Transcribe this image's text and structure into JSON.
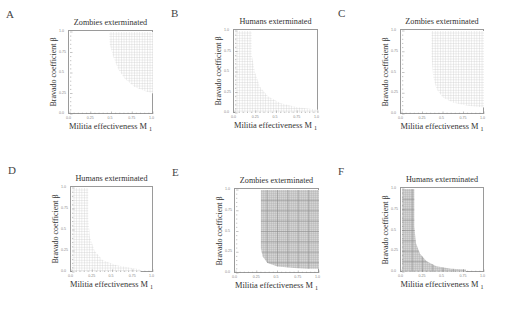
{
  "figure": {
    "panels": [
      {
        "letter": "A",
        "title": "Zombies exterminated",
        "xlabel": "Militia effectiveness M",
        "xsub": "1",
        "ylabel": "Bravado coefficient β",
        "frame": {
          "x": 68,
          "y": 30,
          "w": 85,
          "h": 84
        },
        "density": "sparse",
        "region": "upper-right",
        "boundary": [
          [
            0.47,
            1.0
          ],
          [
            0.48,
            0.85
          ],
          [
            0.52,
            0.7
          ],
          [
            0.58,
            0.55
          ],
          [
            0.66,
            0.43
          ],
          [
            0.78,
            0.33
          ],
          [
            0.9,
            0.28
          ],
          [
            1.0,
            0.25
          ]
        ]
      },
      {
        "letter": "B",
        "title": "Humans exterminated",
        "xlabel": "Militia effectiveness M",
        "xsub": "1",
        "ylabel": "Bravado coefficient β",
        "frame": {
          "x": 233,
          "y": 29,
          "w": 85,
          "h": 84
        },
        "density": "sparse",
        "region": "lower-left",
        "boundary": [
          [
            0.2,
            1.0
          ],
          [
            0.2,
            0.72
          ],
          [
            0.24,
            0.5
          ],
          [
            0.3,
            0.32
          ],
          [
            0.4,
            0.2
          ],
          [
            0.55,
            0.12
          ],
          [
            0.75,
            0.07
          ],
          [
            1.0,
            0.04
          ]
        ]
      },
      {
        "letter": "C",
        "title": "Zombies exterminated",
        "xlabel": "Militia effectiveness M",
        "xsub": "1",
        "ylabel": "Bravado coefficient β",
        "frame": {
          "x": 400,
          "y": 29,
          "w": 84,
          "h": 85
        },
        "density": "sparse",
        "region": "upper-right",
        "boundary": [
          [
            0.36,
            1.0
          ],
          [
            0.36,
            0.7
          ],
          [
            0.38,
            0.45
          ],
          [
            0.42,
            0.3
          ],
          [
            0.5,
            0.2
          ],
          [
            0.62,
            0.14
          ],
          [
            0.8,
            0.1
          ],
          [
            1.0,
            0.08
          ]
        ]
      },
      {
        "letter": "D",
        "title": "Humans exterminated",
        "xlabel": "Militia effectiveness M",
        "xsub": "1",
        "ylabel": "Bravado coefficient β",
        "frame": {
          "x": 70,
          "y": 186,
          "w": 83,
          "h": 86
        },
        "density": "sparse",
        "region": "lower-left",
        "boundary": [
          [
            0.2,
            1.0
          ],
          [
            0.2,
            0.65
          ],
          [
            0.22,
            0.42
          ],
          [
            0.28,
            0.25
          ],
          [
            0.38,
            0.14
          ],
          [
            0.55,
            0.08
          ],
          [
            0.72,
            0.05
          ],
          [
            0.85,
            0.03
          ]
        ]
      },
      {
        "letter": "E",
        "title": "Zombies exterminated",
        "xlabel": "Militia effectiveness M",
        "xsub": "1",
        "ylabel": "Bravado coefficient β",
        "frame": {
          "x": 234,
          "y": 188,
          "w": 85,
          "h": 85
        },
        "density": "dense",
        "region": "upper-right",
        "boundary": [
          [
            0.3,
            1.0
          ],
          [
            0.3,
            0.7
          ],
          [
            0.3,
            0.3
          ],
          [
            0.32,
            0.2
          ],
          [
            0.38,
            0.12
          ],
          [
            0.5,
            0.08
          ],
          [
            0.7,
            0.06
          ],
          [
            0.85,
            0.05
          ],
          [
            1.0,
            0.05
          ]
        ]
      },
      {
        "letter": "F",
        "title": "Humans exterminated",
        "xlabel": "Militia effectiveness M",
        "xsub": "1",
        "ylabel": "Bravado coefficient β",
        "frame": {
          "x": 400,
          "y": 187,
          "w": 84,
          "h": 85
        },
        "density": "dense",
        "region": "lower-left",
        "boundary": [
          [
            0.15,
            1.0
          ],
          [
            0.15,
            0.55
          ],
          [
            0.17,
            0.35
          ],
          [
            0.22,
            0.22
          ],
          [
            0.3,
            0.13
          ],
          [
            0.42,
            0.07
          ],
          [
            0.6,
            0.04
          ],
          [
            0.78,
            0.03
          ]
        ]
      }
    ],
    "xticks": [
      "0.0",
      "0.25",
      "0.5",
      "0.75",
      "1.0"
    ],
    "yticks": [
      "0.0",
      "0.25",
      "0.5",
      "0.75",
      "1.0"
    ]
  },
  "chart_data": [
    {
      "type": "heatmap",
      "panel": "A",
      "title": "Zombies exterminated",
      "xlabel": "Militia effectiveness M1",
      "ylabel": "Bravado coefficient β",
      "xlim": [
        0,
        1
      ],
      "ylim": [
        0,
        1
      ],
      "region_boundary": {
        "x": [
          0.47,
          0.48,
          0.52,
          0.58,
          0.66,
          0.78,
          0.9,
          1.0
        ],
        "y": [
          1.0,
          0.85,
          0.7,
          0.55,
          0.43,
          0.33,
          0.28,
          0.25
        ]
      },
      "shaded": "above boundary"
    },
    {
      "type": "heatmap",
      "panel": "B",
      "title": "Humans exterminated",
      "xlabel": "Militia effectiveness M1",
      "ylabel": "Bravado coefficient β",
      "xlim": [
        0,
        1
      ],
      "ylim": [
        0,
        1
      ],
      "region_boundary": {
        "x": [
          0.2,
          0.2,
          0.24,
          0.3,
          0.4,
          0.55,
          0.75,
          1.0
        ],
        "y": [
          1.0,
          0.72,
          0.5,
          0.32,
          0.2,
          0.12,
          0.07,
          0.04
        ]
      },
      "shaded": "below boundary"
    },
    {
      "type": "heatmap",
      "panel": "C",
      "title": "Zombies exterminated",
      "xlabel": "Militia effectiveness M1",
      "ylabel": "Bravado coefficient β",
      "xlim": [
        0,
        1
      ],
      "ylim": [
        0,
        1
      ],
      "region_boundary": {
        "x": [
          0.36,
          0.36,
          0.38,
          0.42,
          0.5,
          0.62,
          0.8,
          1.0
        ],
        "y": [
          1.0,
          0.7,
          0.45,
          0.3,
          0.2,
          0.14,
          0.1,
          0.08
        ]
      },
      "shaded": "above boundary"
    },
    {
      "type": "heatmap",
      "panel": "D",
      "title": "Humans exterminated",
      "xlabel": "Militia effectiveness M1",
      "ylabel": "Bravado coefficient β",
      "xlim": [
        0,
        1
      ],
      "ylim": [
        0,
        1
      ],
      "region_boundary": {
        "x": [
          0.2,
          0.2,
          0.22,
          0.28,
          0.38,
          0.55,
          0.72,
          0.85
        ],
        "y": [
          1.0,
          0.65,
          0.42,
          0.25,
          0.14,
          0.08,
          0.05,
          0.03
        ]
      },
      "shaded": "below boundary"
    },
    {
      "type": "heatmap",
      "panel": "E",
      "title": "Zombies exterminated",
      "xlabel": "Militia effectiveness M1",
      "ylabel": "Bravado coefficient β",
      "xlim": [
        0,
        1
      ],
      "ylim": [
        0,
        1
      ],
      "region_boundary": {
        "x": [
          0.3,
          0.3,
          0.3,
          0.32,
          0.38,
          0.5,
          0.7,
          0.85,
          1.0
        ],
        "y": [
          1.0,
          0.7,
          0.3,
          0.2,
          0.12,
          0.08,
          0.06,
          0.05,
          0.05
        ]
      },
      "shaded": "above boundary"
    },
    {
      "type": "heatmap",
      "panel": "F",
      "title": "Humans exterminated",
      "xlabel": "Militia effectiveness M1",
      "ylabel": "Bravado coefficient β",
      "xlim": [
        0,
        1
      ],
      "ylim": [
        0,
        1
      ],
      "region_boundary": {
        "x": [
          0.15,
          0.15,
          0.17,
          0.22,
          0.3,
          0.42,
          0.6,
          0.78
        ],
        "y": [
          1.0,
          0.55,
          0.35,
          0.22,
          0.13,
          0.07,
          0.04,
          0.03
        ]
      },
      "shaded": "below boundary"
    }
  ]
}
